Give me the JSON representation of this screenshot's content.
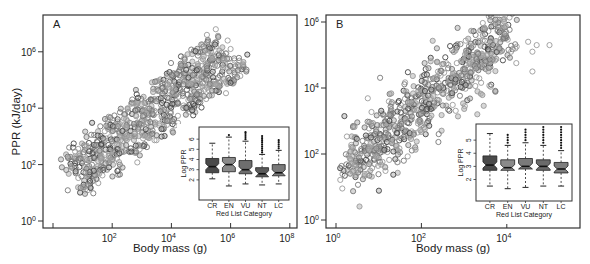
{
  "chart_data": [
    {
      "panel": "A",
      "type": "scatter",
      "title": "A",
      "xlabel": "Body mass (g)",
      "ylabel": "PPR (kJ/day)",
      "xscale": "log",
      "yscale": "log",
      "xlim_log10": [
        -0.3,
        8.1
      ],
      "ylim_log10": [
        -0.2,
        7.3
      ],
      "xticks": [
        {
          "v": 0,
          "label": ""
        },
        {
          "v": 2,
          "label": "10^2"
        },
        {
          "v": 4,
          "label": "10^4"
        },
        {
          "v": 6,
          "label": "10^6"
        },
        {
          "v": 8,
          "label": "10^8"
        }
      ],
      "yticks": [
        {
          "v": 0,
          "label": "10^0"
        },
        {
          "v": 2,
          "label": "10^2"
        },
        {
          "v": 4,
          "label": "10^4"
        },
        {
          "v": 6,
          "label": "10^6"
        }
      ],
      "grid": false,
      "scatter_bands": [
        {
          "name": "upper band",
          "x0": 0.5,
          "x1": 5.6,
          "y0": 2.0,
          "y1": 6.4,
          "width": 0.55,
          "n": 260
        },
        {
          "name": "middle band",
          "x0": 0.8,
          "x1": 5.8,
          "y0": 1.7,
          "y1": 5.8,
          "width": 0.45,
          "n": 240
        },
        {
          "name": "lower band",
          "x0": 0.9,
          "x1": 6.5,
          "y0": 1.2,
          "y1": 5.6,
          "width": 0.45,
          "n": 260
        }
      ],
      "outliers": [
        [
          5.5,
          6.8
        ],
        [
          5.9,
          6.4
        ],
        [
          6.0,
          6.1
        ],
        [
          5.2,
          6.6
        ]
      ],
      "inset": {
        "type": "boxplot",
        "xlabel": "Red List Category",
        "ylabel": "Log PPR",
        "yticks": [
          2,
          3,
          4,
          5,
          6
        ],
        "categories": [
          "CR",
          "EN",
          "VU",
          "NT",
          "LC"
        ],
        "boxes": [
          {
            "cat": "CR",
            "q1": 2.7,
            "median": 3.3,
            "q3": 4.1,
            "whisker_low": 2.1,
            "whisker_high": 5.6,
            "fliers": [],
            "color": "#4a4a4a"
          },
          {
            "cat": "EN",
            "q1": 2.8,
            "median": 3.5,
            "q3": 4.2,
            "whisker_low": 1.4,
            "whisker_high": 6.2,
            "fliers": [
              6.4
            ],
            "color": "#8a8a8a"
          },
          {
            "cat": "VU",
            "q1": 2.6,
            "median": 3.0,
            "q3": 3.9,
            "whisker_low": 1.6,
            "whisker_high": 5.8,
            "fliers": [
              6.0,
              6.2,
              6.4,
              6.6,
              6.7
            ],
            "color": "#6e6e6e"
          },
          {
            "cat": "NT",
            "q1": 2.3,
            "median": 2.6,
            "q3": 3.2,
            "whisker_low": 1.5,
            "whisker_high": 4.5,
            "fliers": [
              4.7,
              4.9,
              5.1,
              5.3,
              5.5,
              5.7,
              5.9,
              6.1,
              6.3
            ],
            "color": "#5a5a5a"
          },
          {
            "cat": "LC",
            "q1": 2.4,
            "median": 2.7,
            "q3": 3.5,
            "whisker_low": 1.6,
            "whisker_high": 4.9,
            "fliers": [
              5.1,
              5.3,
              5.5,
              5.7,
              5.9
            ],
            "color": "#7a7a7a"
          }
        ],
        "ylim": [
          1.2,
          6.9
        ]
      }
    },
    {
      "panel": "B",
      "type": "scatter",
      "title": "B",
      "xlabel": "Body mass (g)",
      "ylabel": "",
      "xscale": "log",
      "yscale": "log",
      "xlim_log10": [
        -0.25,
        5.7
      ],
      "ylim_log10": [
        -0.25,
        6.2
      ],
      "xticks": [
        {
          "v": 0,
          "label": "10^0"
        },
        {
          "v": 2,
          "label": "10^2"
        },
        {
          "v": 4,
          "label": "10^4"
        }
      ],
      "yticks": [
        {
          "v": 0,
          "label": "10^0"
        },
        {
          "v": 2,
          "label": "10^2"
        },
        {
          "v": 4,
          "label": "10^4"
        },
        {
          "v": 6,
          "label": "10^6"
        }
      ],
      "grid": false,
      "scatter_bands": [
        {
          "name": "main cloud",
          "x0": 0.3,
          "x1": 4.0,
          "y0": 1.6,
          "y1": 5.6,
          "width": 1.1,
          "n": 700
        }
      ],
      "outliers": [
        [
          4.5,
          5.4
        ],
        [
          4.6,
          5.1
        ],
        [
          4.7,
          5.3
        ],
        [
          5.0,
          5.3
        ],
        [
          4.6,
          4.5
        ],
        [
          4.1,
          5.1
        ],
        [
          4.2,
          5.2
        ]
      ],
      "inset": {
        "type": "boxplot",
        "xlabel": "Red List Category",
        "ylabel": "Log PPR",
        "yticks": [
          2,
          3,
          4,
          5
        ],
        "categories": [
          "CR",
          "EN",
          "VU",
          "NT",
          "LC"
        ],
        "boxes": [
          {
            "cat": "CR",
            "q1": 2.7,
            "median": 3.1,
            "q3": 3.8,
            "whisker_low": 1.5,
            "whisker_high": 5.5,
            "fliers": [],
            "color": "#4a4a4a"
          },
          {
            "cat": "EN",
            "q1": 2.7,
            "median": 2.9,
            "q3": 3.5,
            "whisker_low": 1.3,
            "whisker_high": 4.6,
            "fliers": [
              4.8,
              5.0,
              5.2,
              5.4
            ],
            "color": "#8a8a8a"
          },
          {
            "cat": "VU",
            "q1": 2.8,
            "median": 3.0,
            "q3": 3.6,
            "whisker_low": 1.4,
            "whisker_high": 4.8,
            "fliers": [
              5.0,
              5.2,
              5.4,
              5.6,
              5.8
            ],
            "color": "#7a7a7a"
          },
          {
            "cat": "NT",
            "q1": 2.7,
            "median": 3.0,
            "q3": 3.5,
            "whisker_low": 1.5,
            "whisker_high": 4.6,
            "fliers": [
              4.8,
              5.0,
              5.2,
              5.4,
              5.6,
              5.8,
              6.0
            ],
            "color": "#6a6a6a"
          },
          {
            "cat": "LC",
            "q1": 2.5,
            "median": 2.8,
            "q3": 3.3,
            "whisker_low": 1.5,
            "whisker_high": 4.2,
            "fliers": [
              4.4,
              4.6,
              4.8,
              5.0,
              5.2,
              5.4,
              5.6,
              5.8,
              6.0
            ],
            "color": "#7e7e7e"
          }
        ],
        "ylim": [
          1.2,
          6.0
        ]
      }
    }
  ],
  "layout": {
    "panels": [
      {
        "frame": [
          43,
          15,
          297,
          228
        ],
        "xmap": [
          53,
          29.6
        ],
        "ymap": [
          221,
          28.2
        ],
        "inset": [
          199,
          127,
          289,
          200
        ],
        "inset_plot": [
          204,
          130,
          287,
          188
        ]
      },
      {
        "frame": [
          326,
          15,
          580,
          228
        ],
        "xmap": [
          336,
          42.7
        ],
        "ymap": [
          220,
          33.0
        ],
        "inset": [
          476,
          124,
          572,
          201
        ],
        "inset_plot": [
          481,
          127,
          570,
          190
        ]
      }
    ]
  },
  "colors": {
    "frame": "#333333",
    "point_light": "#9a9a9a",
    "point_mid": "#777777",
    "point_dark": "#444444",
    "fill": "#b0b0b0"
  }
}
